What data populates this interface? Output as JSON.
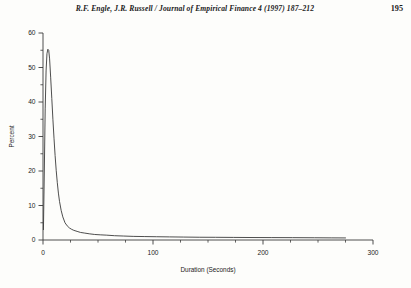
{
  "running_head": {
    "citation": "R.F. Engle, J.R. Russell / Journal of Empirical Finance 4 (1997) 187–212",
    "page_number": "195"
  },
  "chart_data": {
    "type": "line",
    "title": "",
    "xlabel": "Duration  (Seconds)",
    "ylabel": "Percent",
    "xlim": [
      0,
      300
    ],
    "ylim": [
      0,
      60
    ],
    "xticks": [
      0,
      100,
      200,
      300
    ],
    "xtick_labels": [
      "0",
      "100",
      "200",
      "300"
    ],
    "x_minor_ticks": [
      25,
      50,
      75,
      125,
      150,
      175,
      225,
      250,
      275
    ],
    "yticks": [
      0,
      10,
      20,
      30,
      40,
      50,
      60
    ],
    "ytick_labels": [
      "0",
      "10",
      "20",
      "30",
      "40",
      "50",
      "60"
    ],
    "y_minor_ticks": [
      5,
      15,
      25,
      35,
      45,
      55
    ],
    "grid": false,
    "legend": "none",
    "line_color": "#3a3a3a",
    "series": [
      {
        "name": "Duration density (percent)",
        "x": [
          0.4,
          1.2,
          2.0,
          2.8,
          3.6,
          4.4,
          5.2,
          6.0,
          7.0,
          8.0,
          9.0,
          10.0,
          11.0,
          12.0,
          13.0,
          14.0,
          15.0,
          16.5,
          18.0,
          20.0,
          22.0,
          24.0,
          26.0,
          28.0,
          31.0,
          34.0,
          38.0,
          42.0,
          47.0,
          52.0,
          58.0,
          65.0,
          73.0,
          82.0,
          92.0,
          103.0,
          115.0,
          128.0,
          142.0,
          157.0,
          173.0,
          190.0,
          208.0,
          227.0,
          247.0,
          262.0,
          275.0
        ],
        "y": [
          3.0,
          20.0,
          38.0,
          49.0,
          54.0,
          55.3,
          55.0,
          52.5,
          47.0,
          41.0,
          35.0,
          29.5,
          24.5,
          20.2,
          16.6,
          13.6,
          11.2,
          8.6,
          6.7,
          5.0,
          4.1,
          3.5,
          3.1,
          2.8,
          2.5,
          2.2,
          2.0,
          1.8,
          1.6,
          1.5,
          1.4,
          1.25,
          1.15,
          1.05,
          1.0,
          0.95,
          0.9,
          0.85,
          0.8,
          0.78,
          0.75,
          0.72,
          0.7,
          0.68,
          0.65,
          0.62,
          0.6
        ]
      }
    ],
    "annotations": []
  }
}
